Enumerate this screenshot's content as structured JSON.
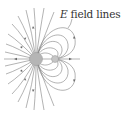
{
  "figure": {
    "label_var": "E",
    "label_text": " field lines"
  },
  "colors": {
    "line": "#777777",
    "charge_fill": "#b5b5b5",
    "text": "#333333"
  }
}
